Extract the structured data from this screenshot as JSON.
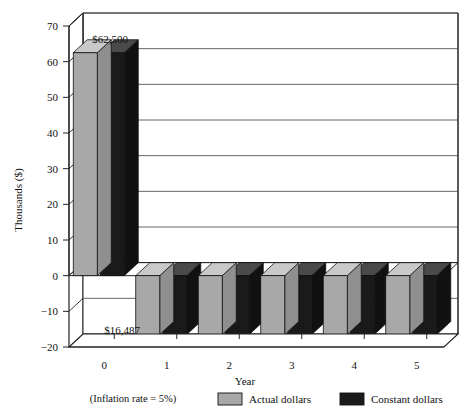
{
  "chart_data": {
    "type": "bar",
    "title": "",
    "subtitle": "",
    "xlabel": "Year",
    "ylabel": "Thousands ($)",
    "categories": [
      "0",
      "1",
      "2",
      "3",
      "4",
      "5"
    ],
    "series": [
      {
        "name": "Actual dollars",
        "color": "#a8a8a8",
        "values": [
          62.5,
          -16.487,
          -16.487,
          -16.487,
          -16.487,
          -16.487
        ]
      },
      {
        "name": "Constant dollars",
        "color": "#1a1a1a",
        "values": [
          62.5,
          -16.487,
          -16.487,
          -16.487,
          -16.487,
          -16.487
        ]
      }
    ],
    "ylim": [
      -20,
      70
    ],
    "yticks": [
      -20,
      -10,
      0,
      10,
      20,
      30,
      40,
      50,
      60,
      70
    ],
    "ytick_labels": [
      "−20",
      "−10",
      "0",
      "10",
      "20",
      "30",
      "40",
      "50",
      "60",
      "70"
    ],
    "xtick_labels": [
      "0",
      "1",
      "2",
      "3",
      "4",
      "5"
    ],
    "grid": true,
    "grid_axis": "y",
    "legend_position": "bottom",
    "three_d": true,
    "annotations": [
      {
        "name": "positive-bar-value",
        "text": "$62,500",
        "x_category": "0",
        "value": 62.5
      },
      {
        "name": "negative-bar-value",
        "text": "$16,487",
        "x_category": "0",
        "value": -16.487
      }
    ],
    "footnote": "(Inflation rate = 5%)"
  },
  "axes": {
    "y_title": "Thousands ($)",
    "x_title": "Year"
  },
  "legend": {
    "items": [
      {
        "label": "Actual dollars",
        "color": "#a8a8a8"
      },
      {
        "label": "Constant dollars",
        "color": "#1a1a1a"
      }
    ]
  },
  "footnote": {
    "text": "(Inflation rate = 5%)"
  },
  "labels": {
    "top_value": "$62,500",
    "bottom_value": "$16,487"
  },
  "colors": {
    "actual": "#a8a8a8",
    "actual_top": "#c9c9c9",
    "actual_side": "#8f8f8f",
    "constant": "#1a1a1a",
    "constant_top": "#4a4a4a",
    "constant_side": "#111111",
    "grid": "#555555",
    "frame": "#222222",
    "floor": "#ffffff"
  }
}
